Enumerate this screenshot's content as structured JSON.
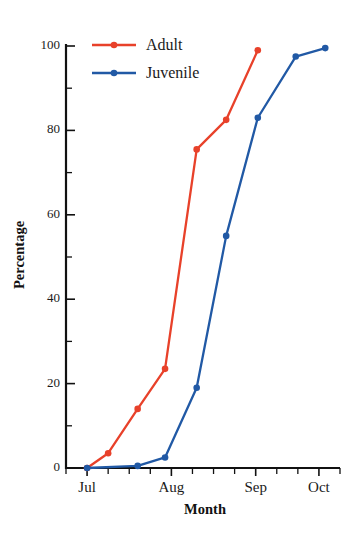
{
  "chart_data": {
    "type": "line",
    "title": "",
    "subtitle": "",
    "xlabel": "Month",
    "ylabel": "Percentage",
    "xlim": [
      0,
      13
    ],
    "ylim": [
      0,
      100
    ],
    "grid": false,
    "legend_position": "top-left",
    "x_tick_labels": [
      "Jul",
      "Aug",
      "Sep",
      "Oct"
    ],
    "x_tick_positions": [
      1,
      5,
      9,
      12
    ],
    "x_minor_tick_positions": [
      0,
      2,
      3,
      4,
      6,
      7,
      8,
      10,
      11,
      13
    ],
    "y_tick_labels": [
      "0",
      "20",
      "40",
      "60",
      "80",
      "100"
    ],
    "y_tick_values": [
      0,
      20,
      40,
      60,
      80,
      100
    ],
    "y_minor_tick_values": [
      10,
      30,
      50,
      70,
      90
    ],
    "x": [
      1,
      2,
      3.4,
      4.7,
      6.2,
      7.6,
      9.1
    ],
    "series": [
      {
        "name": "Adult",
        "color": "#E8412A",
        "x": [
          1,
          2,
          3.4,
          4.7,
          6.2,
          7.6,
          9.1
        ],
        "values": [
          0,
          3.5,
          14,
          23.5,
          75.5,
          82.5,
          99
        ]
      },
      {
        "name": "Juvenile",
        "color": "#2159A5",
        "x": [
          1,
          3.4,
          4.7,
          6.2,
          7.6,
          9.1,
          10.9,
          12.3
        ],
        "values": [
          0,
          0.5,
          2.5,
          19,
          55,
          83,
          97.5,
          99.5
        ]
      }
    ]
  },
  "legend": {
    "entries": [
      {
        "label": "Adult",
        "color": "#E8412A"
      },
      {
        "label": "Juvenile",
        "color": "#2159A5"
      }
    ]
  },
  "axes": {
    "y_title": "Percentage",
    "x_title": "Month"
  },
  "colors": {
    "adult": "#E8412A",
    "juvenile": "#2159A5",
    "axis": "#111111",
    "text": "#1a1a1a",
    "background": "#ffffff"
  }
}
